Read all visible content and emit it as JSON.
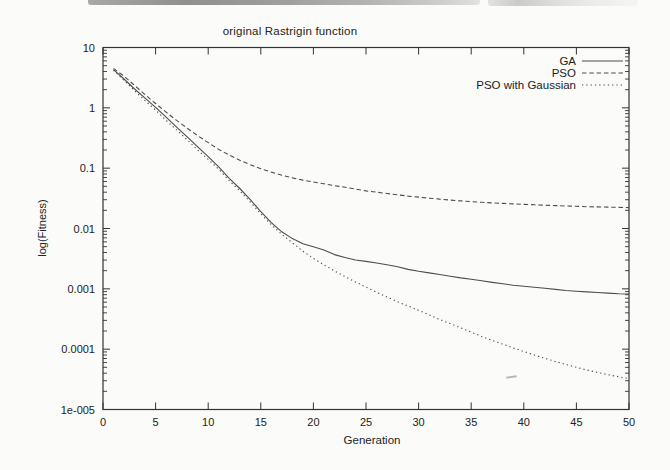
{
  "chart_data": {
    "type": "line",
    "title": "original Rastrigin function",
    "xlabel": "Generation",
    "ylabel": "log(Fitness)",
    "grid": false,
    "legend_position": "top-right-inside",
    "x_axis": {
      "min": 0,
      "max": 50,
      "ticks": [
        0,
        5,
        10,
        15,
        20,
        25,
        30,
        35,
        40,
        45,
        50
      ],
      "tick_labels": [
        "0",
        "5",
        "10",
        "15",
        "20",
        "25",
        "30",
        "35",
        "40",
        "45",
        "50"
      ]
    },
    "y_axis": {
      "scale": "log",
      "min": 1e-05,
      "max": 10,
      "tick_values": [
        10,
        1,
        0.1,
        0.01,
        0.001,
        0.0001,
        1e-05
      ],
      "tick_labels": [
        "10",
        "1",
        "0.1",
        "0.01",
        "0.001",
        "0.0001",
        "1e-005"
      ]
    },
    "colors": {
      "axis": "#333333",
      "line": "#4d4d4d",
      "text": "#1a1a1a"
    },
    "series": [
      {
        "name": "GA",
        "style": "solid",
        "points": [
          [
            1,
            4.3
          ],
          [
            2,
            3.0
          ],
          [
            3,
            2.05
          ],
          [
            4,
            1.45
          ],
          [
            5,
            1.02
          ],
          [
            6,
            0.7
          ],
          [
            7,
            0.48
          ],
          [
            8,
            0.33
          ],
          [
            9,
            0.225
          ],
          [
            10,
            0.155
          ],
          [
            11,
            0.105
          ],
          [
            12,
            0.068
          ],
          [
            13,
            0.046
          ],
          [
            14,
            0.03
          ],
          [
            15,
            0.019
          ],
          [
            16,
            0.0125
          ],
          [
            17,
            0.0088
          ],
          [
            18,
            0.0068
          ],
          [
            19,
            0.0056
          ],
          [
            20,
            0.005
          ],
          [
            21,
            0.0044
          ],
          [
            22,
            0.0037
          ],
          [
            23,
            0.0033
          ],
          [
            24,
            0.003
          ],
          [
            25,
            0.00285
          ],
          [
            26,
            0.00268
          ],
          [
            27,
            0.0025
          ],
          [
            28,
            0.00232
          ],
          [
            29,
            0.0021
          ],
          [
            30,
            0.00195
          ],
          [
            31,
            0.00184
          ],
          [
            32,
            0.00173
          ],
          [
            33,
            0.00162
          ],
          [
            34,
            0.00152
          ],
          [
            35,
            0.00144
          ],
          [
            36,
            0.00136
          ],
          [
            37,
            0.00128
          ],
          [
            38,
            0.00121
          ],
          [
            39,
            0.00115
          ],
          [
            40,
            0.0011
          ],
          [
            41,
            0.00106
          ],
          [
            42,
            0.00102
          ],
          [
            43,
            0.00098
          ],
          [
            44,
            0.00094
          ],
          [
            45,
            0.00091
          ],
          [
            46,
            0.00089
          ],
          [
            47,
            0.00087
          ],
          [
            48,
            0.00085
          ],
          [
            49,
            0.00083
          ],
          [
            50,
            0.00082
          ]
        ]
      },
      {
        "name": "PSO",
        "style": "dashed",
        "points": [
          [
            1,
            4.5
          ],
          [
            2,
            3.35
          ],
          [
            3,
            2.35
          ],
          [
            4,
            1.65
          ],
          [
            5,
            1.18
          ],
          [
            6,
            0.85
          ],
          [
            7,
            0.62
          ],
          [
            8,
            0.46
          ],
          [
            9,
            0.345
          ],
          [
            10,
            0.265
          ],
          [
            11,
            0.205
          ],
          [
            12,
            0.165
          ],
          [
            13,
            0.135
          ],
          [
            14,
            0.114
          ],
          [
            15,
            0.098
          ],
          [
            16,
            0.086
          ],
          [
            17,
            0.0765
          ],
          [
            18,
            0.069
          ],
          [
            19,
            0.0635
          ],
          [
            20,
            0.059
          ],
          [
            21,
            0.055
          ],
          [
            22,
            0.0515
          ],
          [
            23,
            0.0483
          ],
          [
            24,
            0.0452
          ],
          [
            25,
            0.042
          ],
          [
            26,
            0.0399
          ],
          [
            27,
            0.038
          ],
          [
            28,
            0.0362
          ],
          [
            29,
            0.0345
          ],
          [
            30,
            0.0331
          ],
          [
            31,
            0.0318
          ],
          [
            32,
            0.0307
          ],
          [
            33,
            0.0296
          ],
          [
            34,
            0.0287
          ],
          [
            35,
            0.0279
          ],
          [
            36,
            0.0272
          ],
          [
            37,
            0.0266
          ],
          [
            38,
            0.0261
          ],
          [
            39,
            0.0256
          ],
          [
            40,
            0.0251
          ],
          [
            41,
            0.0247
          ],
          [
            42,
            0.0243
          ],
          [
            43,
            0.024
          ],
          [
            44,
            0.0236
          ],
          [
            45,
            0.0233
          ],
          [
            46,
            0.023
          ],
          [
            47,
            0.0228
          ],
          [
            48,
            0.0226
          ],
          [
            49,
            0.0224
          ],
          [
            50,
            0.0222
          ]
        ]
      },
      {
        "name": "PSO with Gaussian",
        "style": "dotted",
        "points": [
          [
            1,
            4.2
          ],
          [
            2,
            2.85
          ],
          [
            3,
            1.92
          ],
          [
            4,
            1.32
          ],
          [
            5,
            0.92
          ],
          [
            6,
            0.62
          ],
          [
            7,
            0.43
          ],
          [
            8,
            0.295
          ],
          [
            9,
            0.2
          ],
          [
            10,
            0.14
          ],
          [
            11,
            0.096
          ],
          [
            12,
            0.062
          ],
          [
            13,
            0.042
          ],
          [
            14,
            0.0275
          ],
          [
            15,
            0.0175
          ],
          [
            16,
            0.0115
          ],
          [
            17,
            0.008
          ],
          [
            18,
            0.0058
          ],
          [
            19,
            0.0042
          ],
          [
            20,
            0.0032
          ],
          [
            21,
            0.0025
          ],
          [
            22,
            0.00198
          ],
          [
            23,
            0.0016
          ],
          [
            24,
            0.0013
          ],
          [
            25,
            0.00107
          ],
          [
            26,
            0.00088
          ],
          [
            27,
            0.00073
          ],
          [
            28,
            0.00061
          ],
          [
            29,
            0.00052
          ],
          [
            30,
            0.00044
          ],
          [
            31,
            0.00037
          ],
          [
            32,
            0.00031
          ],
          [
            33,
            0.000265
          ],
          [
            34,
            0.000225
          ],
          [
            35,
            0.000192
          ],
          [
            36,
            0.000163
          ],
          [
            37,
            0.00014
          ],
          [
            38,
            0.000121
          ],
          [
            39,
            0.000105
          ],
          [
            40,
            9.15e-05
          ],
          [
            41,
            8e-05
          ],
          [
            42,
            7.05e-05
          ],
          [
            43,
            6.25e-05
          ],
          [
            44,
            5.58e-05
          ],
          [
            45,
            5e-05
          ],
          [
            46,
            4.52e-05
          ],
          [
            47,
            4.12e-05
          ],
          [
            48,
            3.78e-05
          ],
          [
            49,
            3.5e-05
          ],
          [
            50,
            3.25e-05
          ]
        ]
      }
    ]
  }
}
